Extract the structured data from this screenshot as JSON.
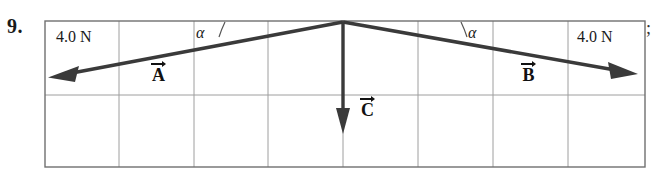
{
  "problem": {
    "number": "9.",
    "trailing_punctuation": ";"
  },
  "figure": {
    "type": "vector-force-diagram",
    "grid": {
      "columns": 8,
      "rows": 2,
      "left": 45,
      "right": 645,
      "top": 21,
      "bottom": 167,
      "middle_row_y": 95,
      "line_color": "#9a9a9a",
      "border_color": "#6f6f6f"
    },
    "labels": {
      "force_left": "4.0 N",
      "force_right": "4.0 N",
      "angle_left": "α",
      "angle_right": "α",
      "vector_a": "A",
      "vector_b": "B",
      "vector_c": "C"
    },
    "vectors": [
      {
        "name": "A",
        "label": "A",
        "magnitude_text": "4.0 N",
        "origin_x": 343,
        "origin_y": 22,
        "tip_x": 50,
        "tip_y": 77,
        "direction": "down-left",
        "color": "#3a3a3a"
      },
      {
        "name": "B",
        "label": "B",
        "magnitude_text": "4.0 N",
        "origin_x": 343,
        "origin_y": 22,
        "tip_x": 637,
        "tip_y": 74,
        "direction": "down-right",
        "color": "#3a3a3a"
      },
      {
        "name": "C",
        "label": "C",
        "magnitude_text": "",
        "origin_x": 343,
        "origin_y": 22,
        "tip_x": 343,
        "tip_y": 133,
        "direction": "down",
        "color": "#3a3a3a"
      }
    ],
    "angle_arcs": [
      {
        "for": "A",
        "cx": 343,
        "cy": 22,
        "label": "α"
      },
      {
        "for": "B",
        "cx": 343,
        "cy": 22,
        "label": "α"
      }
    ]
  }
}
